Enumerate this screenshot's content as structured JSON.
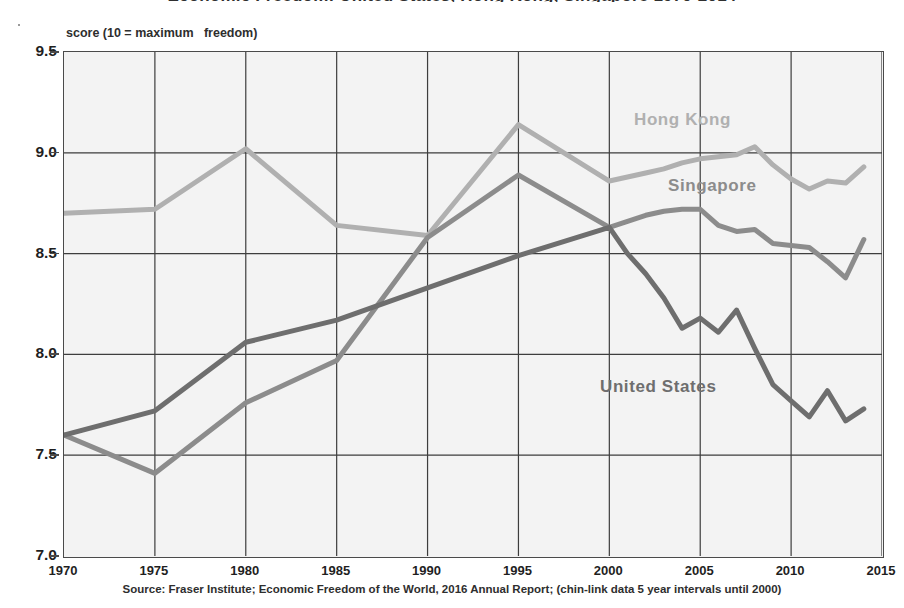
{
  "title": "Economic Freedom: United States, Hong Kong, Singapore 1970-2014",
  "axis_caption": "score (10 = maximum   freedom)",
  "source_note": "Source: Fraser Institute; Economic Freedom of the World, 2016 Annual Report; (chin-link data 5 year intervals until 2000)",
  "colors": {
    "hong_kong": "#b0b0b0",
    "singapore": "#8c8c8c",
    "united_states": "#6e6e6e",
    "grid": "#3d3d3d",
    "frame": "#4a4a4a",
    "plot_bg": "#f3f3f3",
    "text": "#1f1f1f"
  },
  "series_labels": {
    "hong_kong": "Hong Kong",
    "singapore": "Singapore",
    "united_states": "United States"
  },
  "chart_data": {
    "type": "line",
    "title": "Economic Freedom: United States, Hong Kong, Singapore 1970-2014",
    "xlabel": "",
    "ylabel": "score (10 = maximum   freedom)",
    "xlim": [
      1970,
      2015
    ],
    "ylim": [
      7.0,
      9.5
    ],
    "xticks": [
      1970,
      1975,
      1980,
      1985,
      1990,
      1995,
      2000,
      2005,
      2010,
      2015
    ],
    "yticks": [
      7.0,
      7.5,
      8.0,
      8.5,
      9.0,
      9.5
    ],
    "ytick_labels": [
      "7.0",
      "7.5",
      "8.0",
      "8.5",
      "9.0",
      "9.5"
    ],
    "xtick_labels": [
      "1970",
      "1975",
      "1980",
      "1985",
      "1990",
      "1995",
      "2000",
      "2005",
      "2010",
      "2015"
    ],
    "grid": true,
    "legend": "inline-labels",
    "note": "chain-link data at 5 year intervals until 2000, annual thereafter",
    "series": [
      {
        "name": "Hong Kong",
        "color": "#b0b0b0",
        "x": [
          1970,
          1975,
          1980,
          1985,
          1990,
          1995,
          2000,
          2001,
          2002,
          2003,
          2004,
          2005,
          2006,
          2007,
          2008,
          2009,
          2010,
          2011,
          2012,
          2013,
          2014
        ],
        "values": [
          8.7,
          8.72,
          9.02,
          8.64,
          8.59,
          9.14,
          8.86,
          8.88,
          8.9,
          8.92,
          8.95,
          8.97,
          8.98,
          8.99,
          9.03,
          8.94,
          8.87,
          8.82,
          8.86,
          8.85,
          8.93
        ]
      },
      {
        "name": "Singapore",
        "color": "#8c8c8c",
        "x": [
          1970,
          1975,
          1980,
          1985,
          1990,
          1995,
          2000,
          2001,
          2002,
          2003,
          2004,
          2005,
          2006,
          2007,
          2008,
          2009,
          2010,
          2011,
          2012,
          2013,
          2014
        ],
        "values": [
          7.6,
          7.41,
          7.76,
          7.97,
          8.58,
          8.89,
          8.63,
          8.66,
          8.69,
          8.71,
          8.72,
          8.72,
          8.64,
          8.61,
          8.62,
          8.55,
          8.54,
          8.53,
          8.46,
          8.38,
          8.57
        ]
      },
      {
        "name": "United States",
        "color": "#6e6e6e",
        "x": [
          1970,
          1975,
          1980,
          1985,
          1990,
          1995,
          2000,
          2001,
          2002,
          2003,
          2004,
          2005,
          2006,
          2007,
          2008,
          2009,
          2010,
          2011,
          2012,
          2013,
          2014
        ],
        "values": [
          7.6,
          7.72,
          8.06,
          8.17,
          8.33,
          8.49,
          8.63,
          8.5,
          8.4,
          8.28,
          8.13,
          8.18,
          8.11,
          8.22,
          8.03,
          7.85,
          7.77,
          7.69,
          7.82,
          7.67,
          7.73
        ]
      }
    ]
  }
}
